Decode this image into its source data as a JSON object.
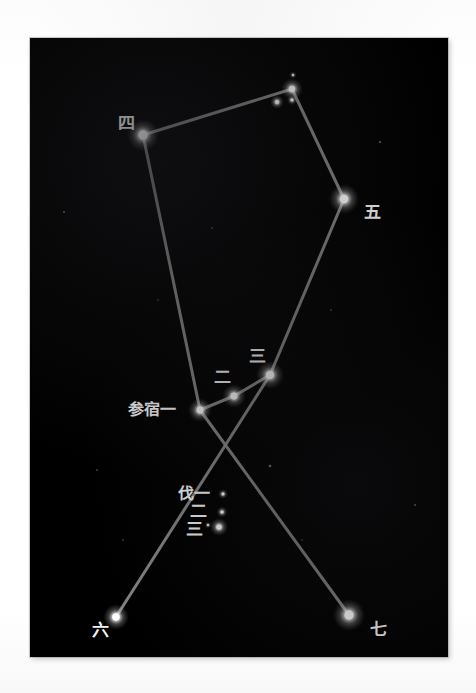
{
  "page": {
    "background_color": "#ffffff",
    "sky_color": "#000000",
    "line_color": "#8e8e8e",
    "star_color": "#ffffff",
    "label_color": "#f2f2f2",
    "frame": {
      "x": 30,
      "y": 38,
      "width": 418,
      "height": 619
    }
  },
  "chart_data": {
    "type": "scatter",
    "title": "",
    "xlabel": "",
    "ylabel": "",
    "grid": false,
    "legend": "none",
    "xlim": [
      0,
      418
    ],
    "ylim": [
      0,
      619
    ],
    "note": "Constellation star map (Orion / Chinese Shen mansion) with traditional Chinese star names",
    "stars": [
      {
        "name": "四",
        "label": "四",
        "x": 143,
        "y": 135,
        "radius": 7.5,
        "label_x": 118,
        "label_y": 129,
        "magnitude": 1.6
      },
      {
        "name": "top-cluster-main",
        "label": "",
        "x": 292,
        "y": 89,
        "radius": 5.0,
        "label_x": 0,
        "label_y": 0,
        "magnitude": 3.4
      },
      {
        "name": "top-cluster-faint-upper",
        "label": "",
        "x": 293,
        "y": 75,
        "radius": 1.6,
        "label_x": 0,
        "label_y": 0,
        "magnitude": 5.5
      },
      {
        "name": "top-cluster-small-lower",
        "label": "",
        "x": 292,
        "y": 100,
        "radius": 2.4,
        "label_x": 0,
        "label_y": 0,
        "magnitude": 4.8
      },
      {
        "name": "top-cluster-left",
        "label": "",
        "x": 277,
        "y": 102,
        "radius": 3.2,
        "label_x": 0,
        "label_y": 0,
        "magnitude": 4.4
      },
      {
        "name": "五",
        "label": "五",
        "x": 344,
        "y": 199,
        "radius": 7.0,
        "label_x": 364,
        "label_y": 218,
        "magnitude": 0.5
      },
      {
        "name": "三",
        "label": "三",
        "x": 270,
        "y": 375,
        "radius": 6.5,
        "label_x": 249,
        "label_y": 362,
        "magnitude": 1.7
      },
      {
        "name": "二",
        "label": "二",
        "x": 234,
        "y": 396,
        "radius": 5.5,
        "label_x": 214,
        "label_y": 383,
        "magnitude": 1.7
      },
      {
        "name": "参宿一",
        "label": "参宿一",
        "x": 200,
        "y": 410,
        "radius": 5.5,
        "label_x": 128,
        "label_y": 415,
        "magnitude": 1.8
      },
      {
        "name": "伐一",
        "label": "伐一",
        "x": 223,
        "y": 494,
        "radius": 2.3,
        "label_x": 178,
        "label_y": 499,
        "magnitude": 4.6
      },
      {
        "name": "伐二",
        "label": "二",
        "x": 222,
        "y": 512,
        "radius": 2.6,
        "label_x": 190,
        "label_y": 517,
        "magnitude": 4.0
      },
      {
        "name": "伐三",
        "label": "三",
        "x": 219,
        "y": 527,
        "radius": 4.2,
        "label_x": 186,
        "label_y": 535,
        "magnitude": 4.0
      },
      {
        "name": "伐三-companion",
        "label": "",
        "x": 208,
        "y": 525,
        "radius": 1.5,
        "label_x": 0,
        "label_y": 0,
        "magnitude": 5.8
      },
      {
        "name": "六",
        "label": "六",
        "x": 116,
        "y": 617,
        "radius": 6.0,
        "label_x": 92,
        "label_y": 636,
        "magnitude": 2.1
      },
      {
        "name": "七",
        "label": "七",
        "x": 349,
        "y": 615,
        "radius": 7.5,
        "label_x": 370,
        "label_y": 635,
        "magnitude": 0.1
      }
    ],
    "background_stars": [
      {
        "x": 270,
        "y": 466,
        "radius": 1.3
      },
      {
        "x": 64,
        "y": 212,
        "radius": 1.0
      },
      {
        "x": 380,
        "y": 142,
        "radius": 0.9
      },
      {
        "x": 212,
        "y": 228,
        "radius": 0.8
      },
      {
        "x": 331,
        "y": 310,
        "radius": 0.8
      },
      {
        "x": 97,
        "y": 470,
        "radius": 0.8
      },
      {
        "x": 415,
        "y": 505,
        "radius": 0.9
      },
      {
        "x": 158,
        "y": 300,
        "radius": 0.7
      },
      {
        "x": 302,
        "y": 540,
        "radius": 0.7
      },
      {
        "x": 123,
        "y": 540,
        "radius": 0.7
      }
    ],
    "lines": [
      {
        "from": "四",
        "to": "top-cluster-main"
      },
      {
        "from": "top-cluster-main",
        "to": "五"
      },
      {
        "from": "四",
        "to": "参宿一"
      },
      {
        "from": "五",
        "to": "三"
      },
      {
        "from": "参宿一",
        "to": "二"
      },
      {
        "from": "二",
        "to": "三"
      },
      {
        "from": "参宿一",
        "to": "七"
      },
      {
        "from": "三",
        "to": "六"
      }
    ]
  },
  "labels": {
    "si": "四",
    "wu": "五",
    "san": "三",
    "er": "二",
    "shenxuyi": "参宿一",
    "fayi": "伐一",
    "faer": "二",
    "fasan": "三",
    "liu": "六",
    "qi": "七"
  }
}
